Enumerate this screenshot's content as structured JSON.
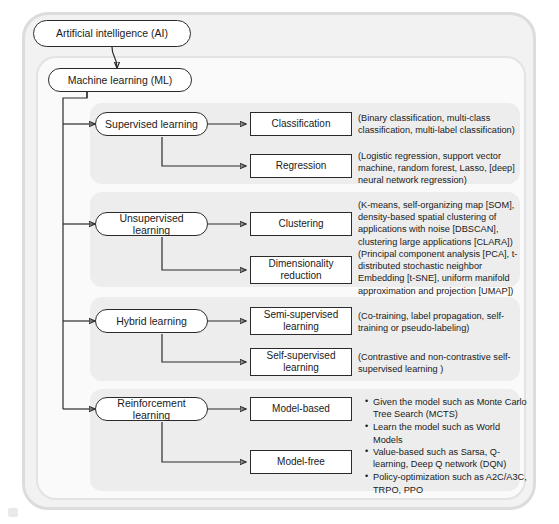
{
  "diagram": {
    "type": "hierarchy-tree",
    "root": {
      "label": "Artificial intelligence (AI)"
    },
    "level1": {
      "label": "Machine learning (ML)"
    },
    "branches": [
      {
        "id": "supervised",
        "label": "Supervised learning",
        "children": [
          {
            "id": "classification",
            "label": "Classification",
            "description": "(Binary classification, multi-class classification, multi-label classification)"
          },
          {
            "id": "regression",
            "label": "Regression",
            "description": "(Logistic regression, support vector machine, random forest, Lasso, [deep] neural network regression)"
          }
        ]
      },
      {
        "id": "unsupervised",
        "label": "Unsupervised learning",
        "children": [
          {
            "id": "clustering",
            "label": "Clustering",
            "description": "(K-means, self-organizing map [SOM], density-based spatial clustering of applications with noise [DBSCAN], clustering large applications [CLARA])"
          },
          {
            "id": "dimensionality-reduction",
            "label": "Dimensionality reduction",
            "description": "(Principal component analysis [PCA], t-distributed stochastic neighbor Embedding [t-SNE], uniform manifold approximation and projection [UMAP])"
          }
        ]
      },
      {
        "id": "hybrid",
        "label": "Hybrid learning",
        "children": [
          {
            "id": "semi-supervised",
            "label": "Semi-supervised learning",
            "description": "(Co-training, label propagation, self-training or pseudo-labeling)"
          },
          {
            "id": "self-supervised",
            "label": "Self-supervised learning",
            "description": "(Contrastive and non-contrastive self-supervised learning )"
          }
        ]
      },
      {
        "id": "reinforcement",
        "label": "Reinforcement learning",
        "children": [
          {
            "id": "model-based",
            "label": "Model-based",
            "bullets": [
              "Given the model such as Monte Carlo Tree Search (MCTS)",
              "Learn the model such as World Models"
            ]
          },
          {
            "id": "model-free",
            "label": "Model-free",
            "bullets": [
              "Value-based such as Sarsa, Q-learning, Deep Q network (DQN)",
              "Policy-optimization such as A2C/A3C, TRPO, PPO"
            ]
          }
        ]
      }
    ],
    "colors": {
      "node_border": "#2b2b2b",
      "node_fill": "#ffffff",
      "panel_fill": "#ededed",
      "ai_frame_fill": "#f2f2f2",
      "ml_frame_fill": "#fafafa",
      "connector": "#2b2b2b",
      "text": "#1a1a1a"
    }
  }
}
